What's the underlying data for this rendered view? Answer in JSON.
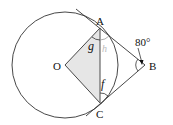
{
  "diagram": {
    "points": {
      "A": {
        "label": "A",
        "x": 100,
        "y": 26
      },
      "B": {
        "label": "B",
        "x": 145,
        "y": 65
      },
      "C": {
        "label": "C",
        "x": 100,
        "y": 103
      },
      "O": {
        "label": "O",
        "x": 65,
        "y": 65
      }
    },
    "angles": {
      "angle_B": "80°",
      "g": "g",
      "f": "f",
      "h": "h"
    },
    "colors": {
      "stroke": "#333333",
      "fill_quad": "#e6e6e6",
      "faint": "#bbbbbb"
    }
  }
}
